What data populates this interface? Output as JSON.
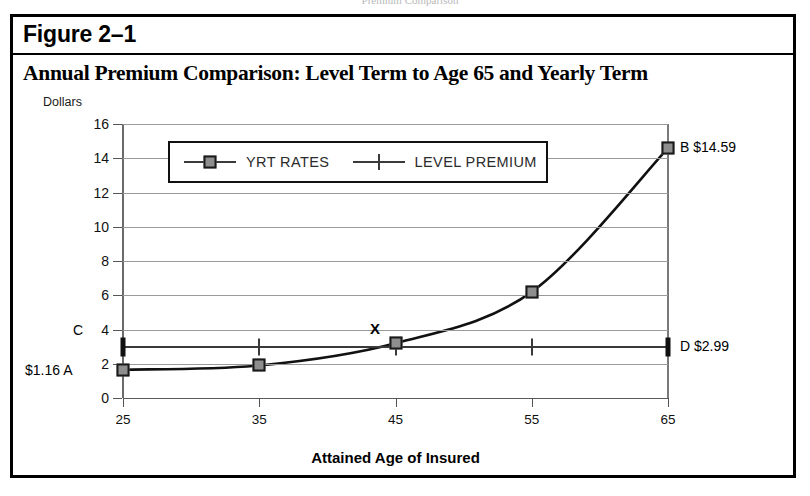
{
  "page": {
    "bleed_text": "Premium Comparison"
  },
  "figure": {
    "label": "Figure 2–1",
    "title": "Annual Premium Comparison:  Level Term to Age 65 and Yearly Term"
  },
  "colors": {
    "marker_fill": "#8e8e8e",
    "marker_border": "#1a1a1a",
    "line": "#111111",
    "grid": "#9a9a9a",
    "frame": "#000000"
  },
  "chart_data": {
    "type": "line",
    "title": "Annual Premium Comparison:  Level Term to Age 65 and Yearly Term",
    "xlabel": "Attained Age of Insured",
    "ylabel": "Dollars",
    "x": [
      25,
      35,
      45,
      55,
      65
    ],
    "xtick_labels": [
      "25",
      "35",
      "45",
      "55",
      "65"
    ],
    "xlim": [
      25,
      65
    ],
    "ylim": [
      0,
      16
    ],
    "yticks": [
      0,
      2,
      4,
      6,
      8,
      10,
      12,
      14,
      16
    ],
    "ytick_labels": [
      "0",
      "2",
      "4",
      "6",
      "8",
      "10",
      "12",
      "14",
      "16"
    ],
    "grid": true,
    "legend_position": "upper-left-inside",
    "series": [
      {
        "name": "YRT RATES",
        "marker": "square",
        "values": [
          1.65,
          1.9,
          3.2,
          6.2,
          14.59
        ]
      },
      {
        "name": "LEVEL PREMIUM",
        "marker": "vertical-tick",
        "values": [
          2.99,
          2.99,
          2.99,
          2.99,
          2.99
        ]
      }
    ],
    "annotations": [
      {
        "key": "point_a",
        "label": "$1.16  A",
        "value": "1.16",
        "x": 25
      },
      {
        "key": "point_c",
        "label": "C",
        "value": "2.99",
        "x": 25
      },
      {
        "key": "crossover",
        "label": "X",
        "x": 43.5,
        "y": 3.75
      },
      {
        "key": "point_b",
        "label": "B  $14.59",
        "value": "14.59",
        "x": 65
      },
      {
        "key": "point_d",
        "label": "D  $2.99",
        "value": "2.99",
        "x": 65
      }
    ]
  },
  "legend": {
    "items": [
      {
        "label": "YRT RATES",
        "marker": "square"
      },
      {
        "label": "LEVEL PREMIUM",
        "marker": "vertical-tick"
      }
    ]
  },
  "annotations": {
    "a_label": "$1.16  A",
    "c_label": "C",
    "b_label": "B  $14.59",
    "d_label": "D  $2.99",
    "x_label": "X"
  }
}
